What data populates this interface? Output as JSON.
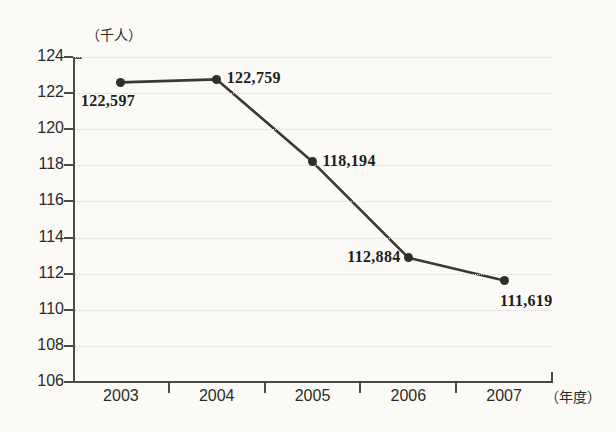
{
  "chart_data": {
    "type": "line",
    "title": "",
    "xlabel": "（年度）",
    "ylabel": "（千人）",
    "categories": [
      "2003",
      "2004",
      "2005",
      "2006",
      "2007"
    ],
    "values": [
      122597,
      122759,
      118194,
      112884,
      111619
    ],
    "values_in_thousands": [
      122.597,
      122.759,
      118.194,
      112.884,
      111.619
    ],
    "point_labels": [
      "122,597",
      "122,759",
      "118,194",
      "112,884",
      "111,619"
    ],
    "ylim": [
      106,
      124
    ],
    "ytick_labels": [
      "124",
      "122",
      "120",
      "118",
      "116",
      "114",
      "112",
      "110",
      "108",
      "106"
    ],
    "ytick_values": [
      124,
      122,
      120,
      118,
      116,
      114,
      112,
      110,
      108,
      106
    ],
    "grid": true,
    "grid_style": "dotted-horizontal",
    "legend": "none",
    "series": [
      {
        "name": "",
        "values": [
          122.597,
          122.759,
          118.194,
          112.884,
          111.619
        ],
        "marker": "filled-circle",
        "line_color": "#3a3a32",
        "marker_color": "#2f2f28"
      }
    ],
    "label_positions": [
      "below-left",
      "right",
      "right",
      "left",
      "below-right"
    ]
  },
  "colors": {
    "background": "#fbfaf7",
    "axis": "#4a4a44",
    "grid": "#d9d5ca",
    "line": "#3a3a32",
    "text": "#2b2b28",
    "data_label": "#1d1d1a"
  }
}
